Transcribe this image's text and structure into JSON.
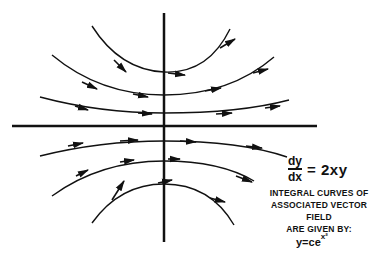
{
  "equation": {
    "numerator": "dy",
    "denominator": "dx",
    "rhs": "= 2xy"
  },
  "caption": {
    "line1": "INTEGRAL CURVES OF",
    "line2": "ASSOCIATED VECTOR FIELD",
    "line3": "ARE GIVEN BY:"
  },
  "solution": {
    "base": "y=ce",
    "exponent": "x²"
  },
  "colors": {
    "ink": "#111111",
    "background": "#ffffff"
  }
}
